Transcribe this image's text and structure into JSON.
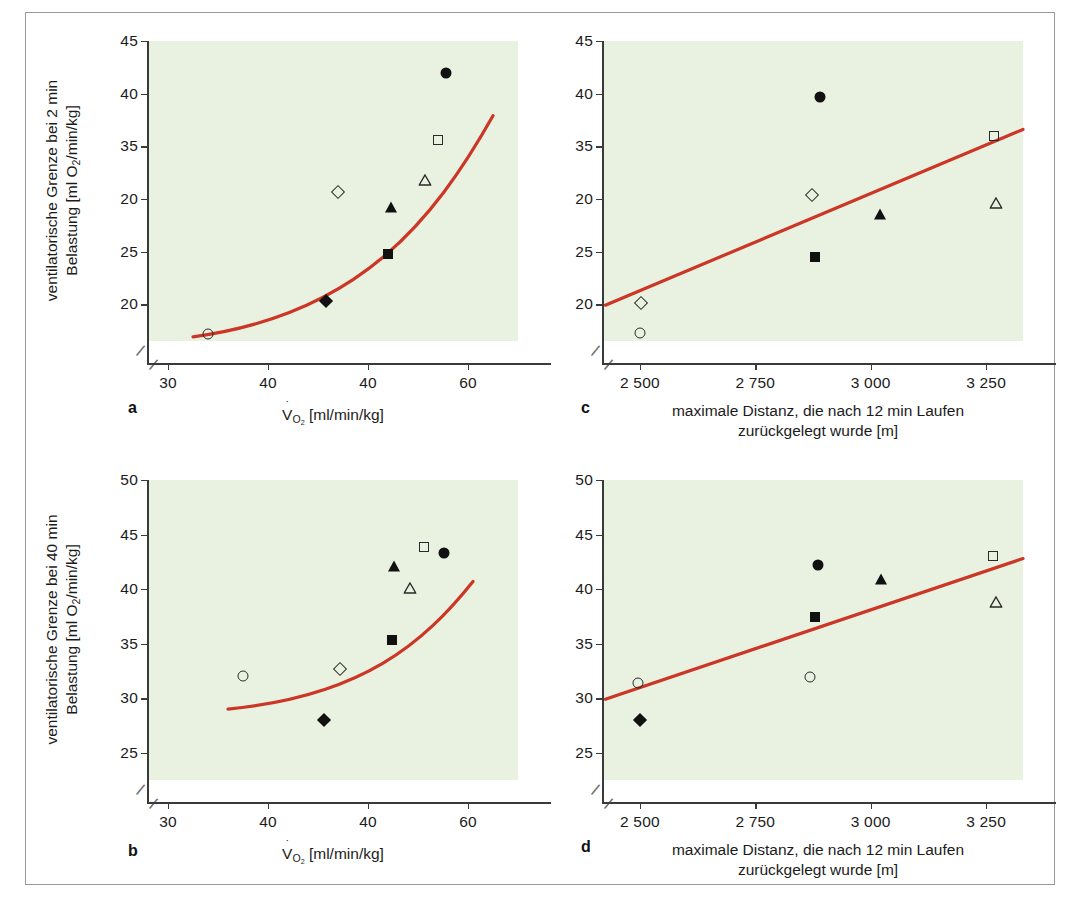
{
  "figure": {
    "panels": [
      "a",
      "b",
      "c",
      "d"
    ],
    "background_color": "#e9f1e1",
    "trend_color": "#cc3626",
    "frame_color": "#9a9a9a"
  },
  "labels": {
    "panel_a_letter": "a",
    "panel_b_letter": "b",
    "panel_c_letter": "c",
    "panel_d_letter": "d",
    "ylabel_a_line1": "ventilatorische Grenze bei 2 min",
    "ylabel_a_line2_pre": "Belastung [ml O",
    "ylabel_a_line2_sub": "2",
    "ylabel_a_line2_post": "/min/kg]",
    "ylabel_b_line1": "ventilatorische Grenze bei 40 min",
    "ylabel_b_line2_pre": "Belastung [ml O",
    "ylabel_b_line2_sub": "2",
    "ylabel_b_line2_post": "/min/kg]",
    "xlabel_vo2_pre": "V",
    "xlabel_vo2_sub": "O",
    "xlabel_vo2_sub2": "2",
    "xlabel_vo2_post": " [ml/min/kg]",
    "xlabel_dist_line1": "maximale Distanz, die nach 12 min Laufen",
    "xlabel_dist_line2": "zurückgelegt wurde [m]"
  },
  "chart_data": [
    {
      "id": "a",
      "type": "scatter",
      "title": "",
      "xlabel": "V̇O2 [ml/min/kg]",
      "ylabel": "ventilatorische Grenze bei 2 min Belastung [ml O2/min/kg]",
      "xlim": [
        28,
        65
      ],
      "ylim": [
        16.5,
        45
      ],
      "axis_break_x": true,
      "axis_break_y": true,
      "grid": false,
      "legend": "none",
      "xticks": [
        30,
        40,
        50,
        60
      ],
      "xticklabels": [
        "30",
        "40",
        "40",
        "60"
      ],
      "yticks": [
        20,
        25,
        30,
        35,
        40,
        45
      ],
      "yticklabels": [
        "20",
        "25",
        "20",
        "35",
        "40",
        "45"
      ],
      "points": [
        {
          "marker": "circle-open",
          "x": 34.0,
          "y": 17.2
        },
        {
          "marker": "diamond-filled",
          "x": 45.8,
          "y": 20.3
        },
        {
          "marker": "square-filled",
          "x": 52.0,
          "y": 24.8
        },
        {
          "marker": "triangle-filled",
          "x": 52.3,
          "y": 29.2
        },
        {
          "marker": "diamond-open",
          "x": 47.0,
          "y": 30.7
        },
        {
          "marker": "triangle-open",
          "x": 55.7,
          "y": 31.8
        },
        {
          "marker": "square-open",
          "x": 57.0,
          "y": 35.6
        },
        {
          "marker": "circle-filled",
          "x": 57.8,
          "y": 42.0
        }
      ],
      "trend": {
        "kind": "curve",
        "x_start": 32.5,
        "x_end": 62.5,
        "y_start": 16.9,
        "y_end": 37.9
      }
    },
    {
      "id": "b",
      "type": "scatter",
      "title": "",
      "xlabel": "V̇O2 [ml/min/kg]",
      "ylabel": "ventilatorische Grenze bei 40 min Belastung [ml O2/min/kg]",
      "xlim": [
        28,
        65
      ],
      "ylim": [
        22.5,
        50
      ],
      "axis_break_x": true,
      "axis_break_y": true,
      "grid": false,
      "legend": "none",
      "xticks": [
        30,
        40,
        50,
        60
      ],
      "xticklabels": [
        "30",
        "40",
        "40",
        "60"
      ],
      "yticks": [
        25,
        30,
        35,
        40,
        45,
        50
      ],
      "yticklabels": [
        "25",
        "30",
        "35",
        "40",
        "45",
        "50"
      ],
      "points": [
        {
          "marker": "circle-open",
          "x": 37.5,
          "y": 32.0
        },
        {
          "marker": "diamond-filled",
          "x": 45.6,
          "y": 28.0
        },
        {
          "marker": "diamond-open",
          "x": 47.2,
          "y": 32.7
        },
        {
          "marker": "square-filled",
          "x": 52.4,
          "y": 35.3
        },
        {
          "marker": "triangle-open",
          "x": 54.2,
          "y": 40.1
        },
        {
          "marker": "triangle-filled",
          "x": 52.6,
          "y": 42.1
        },
        {
          "marker": "square-open",
          "x": 55.6,
          "y": 43.9
        },
        {
          "marker": "circle-filled",
          "x": 57.6,
          "y": 43.3
        }
      ],
      "trend": {
        "kind": "curve",
        "x_start": 36.0,
        "x_end": 60.5,
        "y_start": 29.0,
        "y_end": 40.7
      }
    },
    {
      "id": "c",
      "type": "scatter",
      "title": "",
      "xlabel": "maximale Distanz, die nach 12 min Laufen zurückgelegt wurde [m]",
      "ylabel": "ventilatorische Grenze bei 2 min Belastung [ml O2/min/kg]",
      "xlim": [
        2420,
        3330
      ],
      "ylim": [
        16.5,
        45
      ],
      "axis_break_x": true,
      "axis_break_y": true,
      "grid": false,
      "legend": "none",
      "xticks": [
        2500,
        2750,
        3000,
        3250
      ],
      "xticklabels": [
        "2 500",
        "2 750",
        "3 000",
        "3 250"
      ],
      "yticks": [
        20,
        25,
        30,
        35,
        40,
        45
      ],
      "yticklabels": [
        "20",
        "25",
        "20",
        "35",
        "40",
        "45"
      ],
      "points": [
        {
          "marker": "circle-open",
          "x": 2500,
          "y": 17.3
        },
        {
          "marker": "diamond-open",
          "x": 2502,
          "y": 20.1
        },
        {
          "marker": "square-filled",
          "x": 2880,
          "y": 24.5
        },
        {
          "marker": "diamond-open",
          "x": 2872,
          "y": 30.4
        },
        {
          "marker": "triangle-filled",
          "x": 3020,
          "y": 28.6
        },
        {
          "marker": "circle-filled",
          "x": 2890,
          "y": 39.7
        },
        {
          "marker": "square-open",
          "x": 3268,
          "y": 36.0
        },
        {
          "marker": "triangle-open",
          "x": 3272,
          "y": 29.6
        }
      ],
      "trend": {
        "kind": "line",
        "x_start": 2425,
        "x_end": 3330,
        "y_start": 19.9,
        "y_end": 36.6
      }
    },
    {
      "id": "d",
      "type": "scatter",
      "title": "",
      "xlabel": "maximale Distanz, die nach 12 min Laufen zurückgelegt wurde [m]",
      "ylabel": "ventilatorische Grenze bei 40 min Belastung [ml O2/min/kg]",
      "xlim": [
        2420,
        3330
      ],
      "ylim": [
        22.5,
        50
      ],
      "axis_break_x": true,
      "axis_break_y": true,
      "grid": false,
      "legend": "none",
      "xticks": [
        2500,
        2750,
        3000,
        3250
      ],
      "xticklabels": [
        "2 500",
        "2 750",
        "3 000",
        "3 250"
      ],
      "yticks": [
        25,
        30,
        35,
        40,
        45,
        50
      ],
      "yticklabels": [
        "25",
        "30",
        "35",
        "40",
        "45",
        "50"
      ],
      "points": [
        {
          "marker": "diamond-filled",
          "x": 2500,
          "y": 28.0
        },
        {
          "marker": "circle-open",
          "x": 2495,
          "y": 31.4
        },
        {
          "marker": "circle-open",
          "x": 2868,
          "y": 31.9
        },
        {
          "marker": "square-filled",
          "x": 2880,
          "y": 37.4
        },
        {
          "marker": "circle-filled",
          "x": 2885,
          "y": 42.2
        },
        {
          "marker": "triangle-filled",
          "x": 3022,
          "y": 40.9
        },
        {
          "marker": "square-open",
          "x": 3265,
          "y": 43.0
        },
        {
          "marker": "triangle-open",
          "x": 3272,
          "y": 38.8
        }
      ],
      "trend": {
        "kind": "line",
        "x_start": 2425,
        "x_end": 3330,
        "y_start": 29.9,
        "y_end": 42.8
      }
    }
  ]
}
